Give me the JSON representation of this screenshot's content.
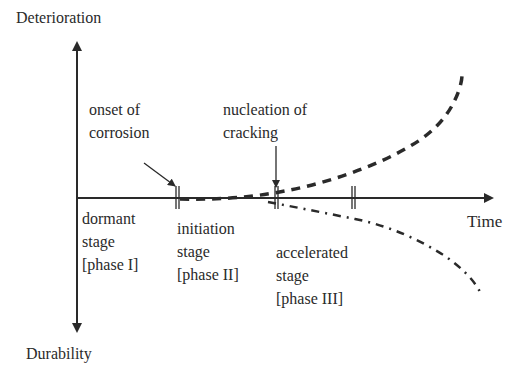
{
  "axes": {
    "y_up_label": "Deterioration",
    "y_down_label": "Durability",
    "x_label": "Time"
  },
  "annotations": {
    "onset": "onset of\ncorrosion",
    "nucleation": "nucleation of\ncracking"
  },
  "stages": [
    {
      "label": "dormant\nstage\n[phase I]"
    },
    {
      "label": "initiation\nstage\n[phase II]"
    },
    {
      "label": "accelerated\nstage\n[phase III]"
    }
  ],
  "curves": [
    {
      "name": "deterioration",
      "style": "dashed",
      "direction": "up"
    },
    {
      "name": "durability",
      "style": "dash-dot",
      "direction": "down"
    }
  ],
  "colors": {
    "line": "#2a2a2a",
    "background": "#ffffff"
  }
}
